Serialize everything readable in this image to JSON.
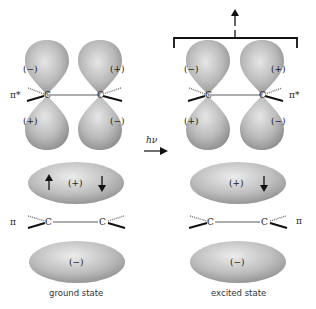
{
  "diagram": {
    "type": "molecular-orbital-diagram",
    "transition_label": "hν",
    "orbital_labels": {
      "pi_star": "π*",
      "pi": "π"
    },
    "atom_label": "C",
    "lobe_signs": {
      "plus": "(+)",
      "minus": "(−)"
    },
    "states": [
      {
        "caption": "ground state",
        "pi_star_lobes": {
          "left_top": "(−)",
          "left_bottom": "(+)",
          "right_top": "(+)",
          "right_bottom": "(−)"
        },
        "pi_lobes": {
          "top": "(+)",
          "bottom": "(−)"
        },
        "pi_electrons": [
          "up",
          "down"
        ],
        "pi_star_electrons": []
      },
      {
        "caption": "excited state",
        "pi_star_lobes": {
          "left_top": "(−)",
          "left_bottom": "(+)",
          "right_top": "(+)",
          "right_bottom": "(−)"
        },
        "pi_lobes": {
          "top": "(+)",
          "bottom": "(−)"
        },
        "pi_electrons": [
          "down"
        ],
        "pi_star_electrons": [
          "up"
        ]
      }
    ],
    "colors": {
      "lobe_fill": "#b8b8b8",
      "lobe_dark": "#8a8a8a",
      "line": "#222222"
    }
  }
}
